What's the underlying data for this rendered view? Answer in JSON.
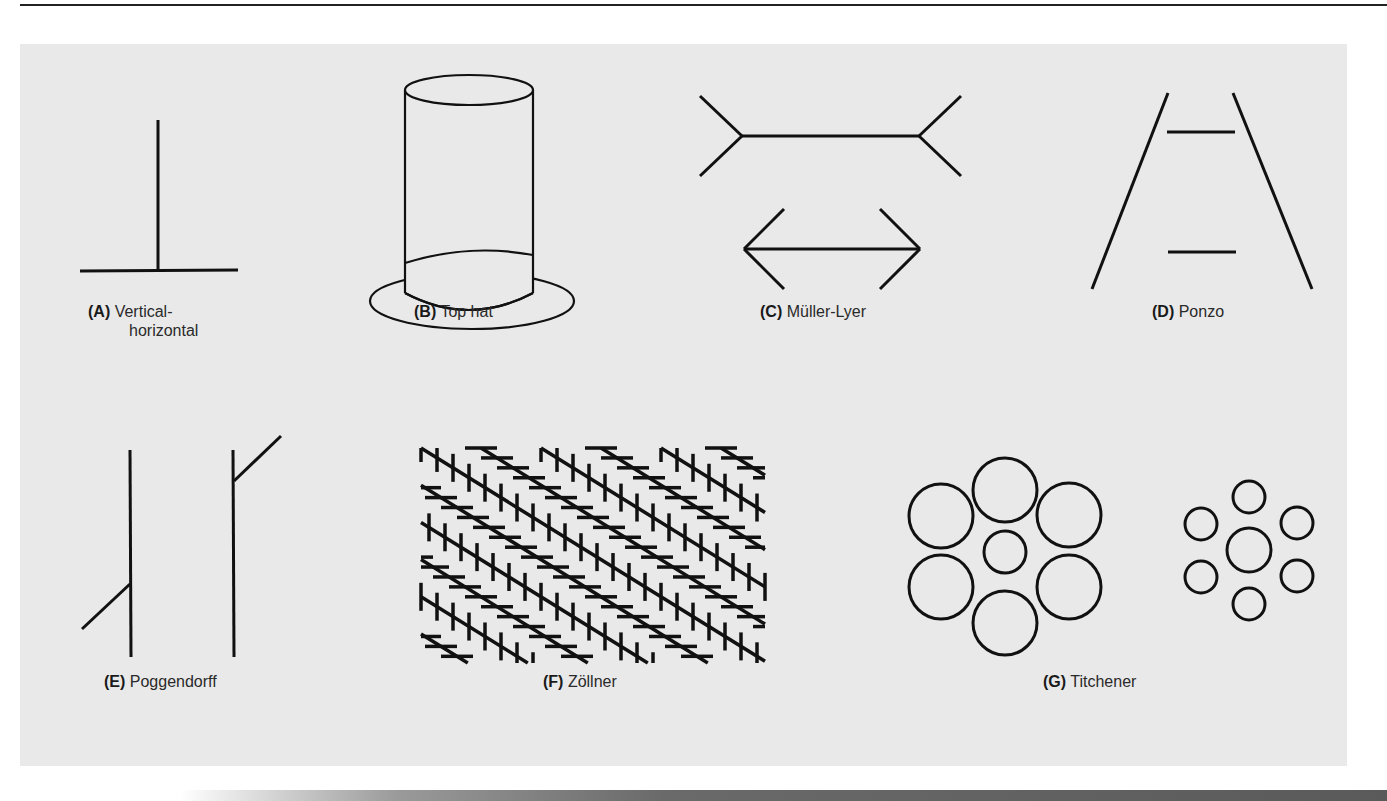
{
  "figure": {
    "panels": [
      {
        "letter": "(A)",
        "name": "Vertical-",
        "name_line2": "horizontal"
      },
      {
        "letter": "(B)",
        "name": "Top hat"
      },
      {
        "letter": "(C)",
        "name": "Müller-Lyer"
      },
      {
        "letter": "(D)",
        "name": "Ponzo"
      },
      {
        "letter": "(E)",
        "name": "Poggendorff"
      },
      {
        "letter": "(F)",
        "name": "Zöllner"
      },
      {
        "letter": "(G)",
        "name": "Titchener"
      }
    ],
    "colors": {
      "panel_background": "#e9e9e9",
      "stroke": "#111111",
      "page_background": "#ffffff"
    }
  }
}
